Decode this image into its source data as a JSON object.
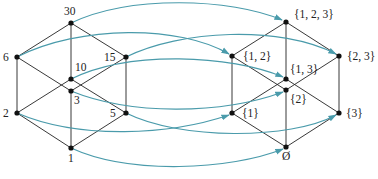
{
  "diagram": {
    "type": "lattice-isomorphism",
    "colors": {
      "edge": "#222222",
      "mapping": "#4a9bab",
      "node": "#111111"
    },
    "left_lattice": {
      "name": "divisors of 30",
      "nodes": [
        {
          "id": "30",
          "label": "30",
          "x": 71,
          "y": 23
        },
        {
          "id": "6",
          "label": "6",
          "x": 17,
          "y": 57
        },
        {
          "id": "15",
          "label": "15",
          "x": 126,
          "y": 57
        },
        {
          "id": "10",
          "label": "10",
          "x": 71,
          "y": 79
        },
        {
          "id": "3",
          "label": "3",
          "x": 71,
          "y": 91
        },
        {
          "id": "2",
          "label": "2",
          "x": 17,
          "y": 113
        },
        {
          "id": "5",
          "label": "5",
          "x": 126,
          "y": 113
        },
        {
          "id": "1",
          "label": "1",
          "x": 71,
          "y": 148
        }
      ]
    },
    "right_lattice": {
      "name": "subsets of {1,2,3}",
      "nodes": [
        {
          "id": "s123",
          "label": "{1, 2, 3}",
          "x": 286,
          "y": 22
        },
        {
          "id": "s12",
          "label": "{1, 2}",
          "x": 232,
          "y": 56
        },
        {
          "id": "s23",
          "label": "{2, 3}",
          "x": 339,
          "y": 56
        },
        {
          "id": "s13",
          "label": "{1, 3}",
          "x": 286,
          "y": 79
        },
        {
          "id": "s2",
          "label": "{2}",
          "x": 286,
          "y": 90
        },
        {
          "id": "s1",
          "label": "{1}",
          "x": 232,
          "y": 113
        },
        {
          "id": "s3",
          "label": "{3}",
          "x": 339,
          "y": 113
        },
        {
          "id": "s0",
          "label": "Ø",
          "x": 286,
          "y": 147
        }
      ]
    },
    "mappings": [
      {
        "from": "30",
        "to": "{1, 2, 3}"
      },
      {
        "from": "6",
        "to": "{1, 2}"
      },
      {
        "from": "15",
        "to": "{2, 3}"
      },
      {
        "from": "10",
        "to": "{1, 3}"
      },
      {
        "from": "3",
        "to": "{2}"
      },
      {
        "from": "2",
        "to": "{1}"
      },
      {
        "from": "5",
        "to": "{3}"
      },
      {
        "from": "1",
        "to": "Ø"
      }
    ]
  }
}
